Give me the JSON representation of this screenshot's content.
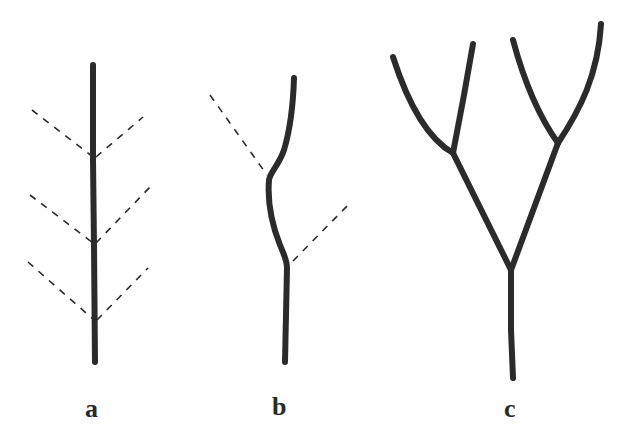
{
  "figure": {
    "panels": [
      {
        "id": "a",
        "label": "a",
        "type": "monopodial",
        "main_axis": [
          [
            93,
            65
          ],
          [
            95,
            362
          ]
        ],
        "lateral_dashed": [
          [
            [
              32,
              110
            ],
            [
              93,
              157
            ]
          ],
          [
            [
              95,
              157
            ],
            [
              143,
              117
            ]
          ],
          [
            [
              30,
              195
            ],
            [
              93,
              243
            ]
          ],
          [
            [
              95,
              243
            ],
            [
              150,
              187
            ]
          ],
          [
            [
              28,
              262
            ],
            [
              94,
              320
            ]
          ],
          [
            [
              96,
              320
            ],
            [
              148,
              268
            ]
          ]
        ]
      },
      {
        "id": "b",
        "label": "b",
        "type": "sympodial",
        "main_axis": [
          [
            294,
            78
          ],
          [
            287,
            125
          ],
          [
            269,
            176
          ],
          [
            272,
            220
          ],
          [
            287,
            265
          ],
          [
            285,
            362
          ]
        ],
        "lateral_dashed": [
          [
            [
              210,
              95
            ],
            [
              268,
              176
            ]
          ],
          [
            [
              292,
              262
            ],
            [
              351,
              202
            ]
          ]
        ]
      },
      {
        "id": "c",
        "label": "c",
        "type": "dichotomous",
        "segments": [
          [
            [
              512,
              378
            ],
            [
              511,
              270
            ]
          ],
          [
            [
              511,
              270
            ],
            [
              453,
              153
            ]
          ],
          [
            [
              511,
              270
            ],
            [
              558,
              143
            ]
          ],
          [
            [
              453,
              153
            ],
            [
              393,
              57
            ]
          ],
          [
            [
              453,
              153
            ],
            [
              473,
              44
            ]
          ],
          [
            [
              558,
              143
            ],
            [
              513,
              40
            ]
          ],
          [
            [
              558,
              143
            ],
            [
              601,
              24
            ]
          ]
        ]
      }
    ]
  },
  "labels": {
    "a": "a",
    "b": "b",
    "c": "c"
  },
  "colors": {
    "stroke": "#2b2b2b",
    "background": "#fefefe"
  }
}
